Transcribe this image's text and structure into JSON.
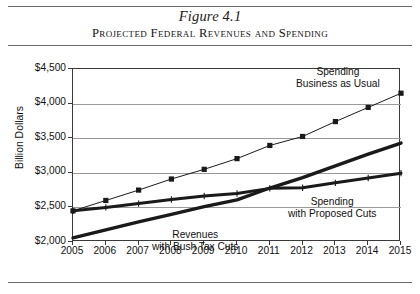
{
  "figure": {
    "number": "Figure 4.1",
    "title": "Projected Federal Revenues and Spending"
  },
  "chart_data": {
    "type": "line",
    "title": "Projected Federal Revenues and Spending",
    "xlabel": "",
    "ylabel": "Billion Dollars",
    "categories": [
      "2005",
      "2006",
      "2007",
      "2008",
      "2009",
      "2010",
      "2011",
      "2012",
      "2013",
      "2014",
      "2015"
    ],
    "x": [
      2005,
      2006,
      2007,
      2008,
      2009,
      2010,
      2011,
      2012,
      2013,
      2014,
      2015
    ],
    "ylim": [
      2000,
      4500
    ],
    "ytick_labels": [
      "$4,500",
      "$4,000",
      "$3,500",
      "$3,000",
      "$2,500",
      "$2,000"
    ],
    "ytick_values": [
      4500,
      4000,
      3500,
      3000,
      2500,
      2000
    ],
    "grid": true,
    "legend_position": "inline-annotations",
    "series": [
      {
        "name": "Spending Business as Usual",
        "label_line1": "Spending",
        "label_line2": "Business as Usual",
        "marker": "square",
        "color": "#1a1a1a",
        "line_width": 1,
        "values": [
          2450,
          2600,
          2750,
          2910,
          3050,
          3205,
          3395,
          3525,
          3740,
          3945,
          4150
        ]
      },
      {
        "name": "Spending with Proposed Cuts",
        "label_line1": "Spending",
        "label_line2": "with Proposed Cuts",
        "marker": "tick",
        "color": "#1a1a1a",
        "line_width": 3,
        "values": [
          2450,
          2500,
          2555,
          2615,
          2665,
          2700,
          2775,
          2785,
          2855,
          2925,
          2995
        ]
      },
      {
        "name": "Revenues with Bush Tax Cuts",
        "label_line1": "Revenues",
        "label_line2": "with Bush Tax Cuts",
        "marker": "none",
        "color": "#1a1a1a",
        "line_width": 3.4,
        "values": [
          2060,
          2175,
          2290,
          2400,
          2510,
          2610,
          2780,
          2930,
          3100,
          3270,
          3430
        ]
      }
    ]
  }
}
